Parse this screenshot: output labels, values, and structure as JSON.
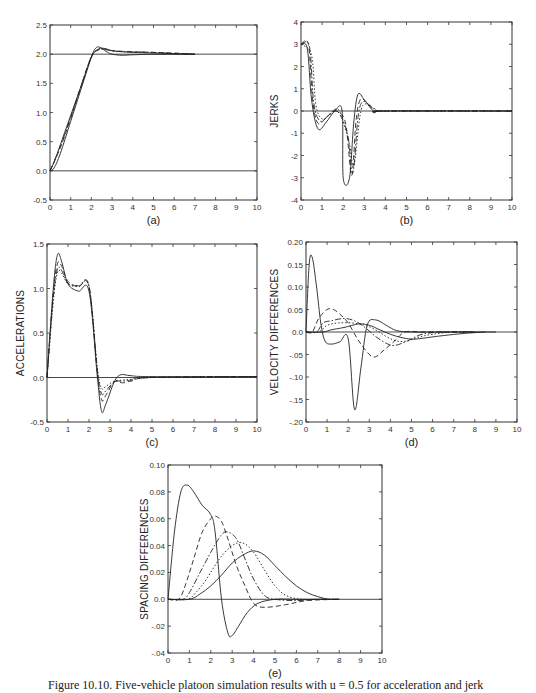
{
  "caption": "Figure 10.10. Five-vehicle platoon simulation results with u = 0.5 for acceleration and jerk",
  "chart_data": [
    {
      "panel": "(a)",
      "type": "line",
      "title": "",
      "xlabel": "",
      "ylabel": "",
      "xlim": [
        0,
        10
      ],
      "ylim": [
        -0.5,
        2.5
      ],
      "xticks": [
        "0",
        "1",
        "2",
        "3",
        "4",
        "5",
        "6",
        "7",
        "8",
        "9",
        "10"
      ],
      "yticks": [
        "-0.5",
        "0.0",
        "0.5",
        "1.0",
        "1.5",
        "2.0",
        "2.5"
      ],
      "reference_lines": [
        0.0,
        2.0
      ],
      "series": [
        {
          "name": "lead",
          "style": "solid",
          "x": [
            0,
            0.2,
            0.5,
            1,
            1.5,
            2,
            2.2,
            2.4,
            2.7,
            3,
            3.5,
            4,
            5,
            6,
            7
          ],
          "y": [
            0,
            0.05,
            0.3,
            0.85,
            1.4,
            1.95,
            2.1,
            2.12,
            2.05,
            2.0,
            1.98,
            1.99,
            2.0,
            2.0,
            2.0
          ]
        },
        {
          "name": "follower-1",
          "style": "solid",
          "x": [
            0,
            0.2,
            0.5,
            1,
            1.5,
            2,
            2.3,
            2.6,
            3,
            3.5,
            4,
            5,
            6,
            7
          ],
          "y": [
            0,
            0.15,
            0.45,
            0.95,
            1.45,
            1.95,
            2.08,
            2.1,
            2.06,
            2.04,
            2.03,
            2.02,
            2.01,
            2.0
          ]
        },
        {
          "name": "follower-2",
          "style": "dashed",
          "x": [
            0,
            0.5,
            1,
            1.5,
            2,
            2.3,
            2.6,
            3,
            3.5,
            4,
            5,
            6,
            7
          ],
          "y": [
            0,
            0.4,
            0.9,
            1.45,
            1.95,
            2.07,
            2.09,
            2.06,
            2.05,
            2.04,
            2.03,
            2.02,
            2.0
          ]
        },
        {
          "name": "follower-3",
          "style": "dashdot",
          "x": [
            0,
            0.5,
            1,
            1.5,
            2,
            2.4,
            2.8,
            3.2,
            4,
            5,
            6,
            7
          ],
          "y": [
            0,
            0.42,
            0.92,
            1.45,
            1.96,
            2.08,
            2.07,
            2.05,
            2.04,
            2.03,
            2.01,
            2.0
          ]
        }
      ]
    },
    {
      "panel": "(b)",
      "type": "line",
      "title": "",
      "xlabel": "",
      "ylabel": "JERKS",
      "xlim": [
        0,
        10
      ],
      "ylim": [
        -4,
        4
      ],
      "xticks": [
        "0",
        "1",
        "2",
        "3",
        "4",
        "5",
        "6",
        "7",
        "8",
        "9",
        "10"
      ],
      "yticks": [
        "-4",
        "-3",
        "-2",
        "-1",
        "0",
        "1",
        "2",
        "3",
        "4"
      ],
      "reference_lines": [
        0
      ],
      "series": [
        {
          "name": "lead",
          "style": "solid",
          "x": [
            0,
            0.3,
            0.5,
            0.8,
            1.2,
            1.6,
            1.95,
            2.0,
            2.3,
            2.5,
            2.7,
            3.0,
            3.5,
            4,
            10
          ],
          "y": [
            3,
            2.8,
            0.5,
            -0.8,
            -0.5,
            0,
            0,
            -3,
            -3,
            -0.5,
            0.75,
            0.5,
            -0.05,
            0,
            0
          ]
        },
        {
          "name": "follower-1",
          "style": "dashed",
          "x": [
            0,
            0.35,
            0.55,
            0.8,
            1.2,
            1.6,
            2.1,
            2.4,
            2.6,
            2.8,
            3.1,
            3.5,
            4,
            10
          ],
          "y": [
            3,
            3,
            0.5,
            -0.55,
            -0.3,
            0,
            -0.5,
            -2.9,
            -0.5,
            0.5,
            0.4,
            0,
            0,
            0
          ]
        },
        {
          "name": "follower-2",
          "style": "dashdot",
          "x": [
            0,
            0.4,
            0.6,
            0.9,
            1.3,
            1.7,
            2.2,
            2.45,
            2.7,
            2.9,
            3.2,
            3.6,
            4,
            10
          ],
          "y": [
            3,
            2.9,
            0.4,
            -0.45,
            -0.2,
            0.02,
            -1,
            -2.8,
            -0.3,
            0.4,
            0.3,
            0,
            0,
            0
          ]
        },
        {
          "name": "follower-3",
          "style": "dotted",
          "x": [
            0,
            0.5,
            0.7,
            1.0,
            1.4,
            1.8,
            2.3,
            2.5,
            2.8,
            3.0,
            3.3,
            3.7,
            4,
            10
          ],
          "y": [
            3,
            2.5,
            0.3,
            -0.35,
            -0.15,
            0.03,
            -1.5,
            -2.5,
            -0.2,
            0.3,
            0.2,
            0,
            0,
            0
          ]
        }
      ]
    },
    {
      "panel": "(c)",
      "type": "line",
      "title": "",
      "xlabel": "",
      "ylabel": "ACCELERATIONS",
      "xlim": [
        0,
        10
      ],
      "ylim": [
        -0.5,
        1.5
      ],
      "xticks": [
        "0",
        "1",
        "2",
        "3",
        "4",
        "5",
        "6",
        "7",
        "8",
        "9",
        "10"
      ],
      "yticks": [
        "-0.5",
        "0.0",
        "0.5",
        "1.0",
        "1.5"
      ],
      "reference_lines": [
        0.0
      ],
      "series": [
        {
          "name": "lead",
          "style": "solid",
          "x": [
            0,
            0.3,
            0.5,
            0.7,
            1.0,
            1.5,
            2.0,
            2.4,
            2.6,
            2.8,
            3.2,
            3.5,
            4,
            5,
            10
          ],
          "y": [
            0,
            1.0,
            1.38,
            1.3,
            1.05,
            0.97,
            0.97,
            0.0,
            -0.38,
            -0.3,
            -0.05,
            0.03,
            0.02,
            0.01,
            0.01
          ]
        },
        {
          "name": "follower-1",
          "style": "dashed",
          "x": [
            0,
            0.3,
            0.5,
            0.7,
            1.0,
            1.5,
            2.0,
            2.4,
            2.6,
            2.8,
            3.2,
            3.6,
            4,
            5,
            10
          ],
          "y": [
            0,
            0.95,
            1.28,
            1.25,
            1.08,
            1.02,
            1.02,
            0.05,
            -0.25,
            -0.2,
            -0.05,
            -0.06,
            -0.04,
            0.0,
            0.01
          ]
        },
        {
          "name": "follower-2",
          "style": "dashdot",
          "x": [
            0,
            0.3,
            0.5,
            0.7,
            1.0,
            1.5,
            2.0,
            2.4,
            2.6,
            2.8,
            3.2,
            3.6,
            4,
            5,
            10
          ],
          "y": [
            0,
            0.9,
            1.22,
            1.2,
            1.06,
            1.03,
            1.03,
            0.07,
            -0.18,
            -0.15,
            -0.05,
            -0.04,
            -0.03,
            0.0,
            0.01
          ]
        },
        {
          "name": "follower-3",
          "style": "dotted",
          "x": [
            0,
            0.3,
            0.5,
            0.7,
            1.0,
            1.5,
            2.0,
            2.4,
            2.6,
            2.8,
            3.2,
            3.6,
            4,
            5,
            10
          ],
          "y": [
            0,
            0.85,
            1.18,
            1.17,
            1.05,
            1.02,
            1.02,
            0.1,
            -0.12,
            -0.1,
            -0.04,
            -0.03,
            -0.02,
            0.0,
            0.01
          ]
        }
      ]
    },
    {
      "panel": "(d)",
      "type": "line",
      "title": "",
      "xlabel": "",
      "ylabel": "VELOCITY DIFFERENCES",
      "xlim": [
        0,
        10
      ],
      "ylim": [
        -0.2,
        0.2
      ],
      "xticks": [
        "0",
        "1",
        "2",
        "3",
        "4",
        "5",
        "6",
        "7",
        "8",
        "9",
        "10"
      ],
      "yticks": [
        "-.20",
        "-.15",
        "-.10",
        "-.05",
        "0.0",
        "0.05",
        "0.10",
        "0.15",
        "0.20"
      ],
      "reference_lines": [
        0.0
      ],
      "series": [
        {
          "name": "diff-1",
          "style": "solid",
          "x": [
            0,
            0.15,
            0.3,
            0.5,
            0.7,
            0.9,
            1.2,
            1.6,
            2.0,
            2.3,
            2.6,
            2.9,
            3.3,
            3.8,
            4.3,
            5,
            6,
            7,
            8,
            9
          ],
          "y": [
            0.0,
            0.15,
            0.165,
            0.1,
            0.02,
            -0.02,
            -0.027,
            -0.022,
            -0.015,
            -0.172,
            -0.08,
            0.015,
            0.027,
            0.015,
            0.003,
            0.0,
            0.0,
            0.0,
            0.0,
            0.0
          ]
        },
        {
          "name": "diff-2",
          "style": "dashed",
          "x": [
            0,
            0.3,
            0.6,
            1.0,
            1.3,
            1.6,
            2.0,
            2.5,
            3.0,
            3.3,
            3.7,
            4.2,
            4.7,
            5.5,
            6.5,
            8
          ],
          "y": [
            0,
            0.0,
            0.03,
            0.05,
            0.05,
            0.04,
            0.02,
            -0.02,
            -0.05,
            -0.055,
            -0.04,
            -0.02,
            0.0,
            0.0,
            0.0,
            0.0
          ]
        },
        {
          "name": "diff-3",
          "style": "dashdot",
          "x": [
            0,
            0.5,
            0.8,
            1.2,
            1.8,
            2.3,
            2.8,
            3.3,
            3.8,
            4.2,
            4.8,
            5.5,
            6.5,
            8
          ],
          "y": [
            0,
            0.0,
            0.02,
            0.025,
            0.03,
            0.025,
            0.01,
            -0.01,
            -0.025,
            -0.03,
            -0.02,
            -0.005,
            0.0,
            0.0
          ]
        },
        {
          "name": "diff-4",
          "style": "dotted",
          "x": [
            0,
            0.6,
            1.0,
            1.5,
            2.2,
            2.8,
            3.3,
            3.8,
            4.3,
            4.8,
            5.3,
            6,
            7,
            8
          ],
          "y": [
            0,
            0.0,
            0.015,
            0.02,
            0.02,
            0.015,
            0.005,
            -0.01,
            -0.02,
            -0.02,
            -0.012,
            -0.005,
            0.0,
            0.0
          ]
        },
        {
          "name": "diff-5",
          "style": "solid",
          "x": [
            0,
            0.8,
            1.2,
            1.8,
            2.5,
            3.0,
            3.5,
            4.0,
            4.5,
            5.0,
            5.5,
            6.5,
            7.5,
            8.5
          ],
          "y": [
            0,
            0.0,
            0.005,
            0.01,
            0.018,
            0.015,
            0.005,
            -0.005,
            -0.012,
            -0.016,
            -0.014,
            -0.008,
            -0.003,
            0.0
          ]
        }
      ]
    },
    {
      "panel": "(e)",
      "type": "line",
      "title": "",
      "xlabel": "",
      "ylabel": "SPACING DIFFERENCES",
      "xlim": [
        0,
        10
      ],
      "ylim": [
        -0.04,
        0.1
      ],
      "xticks": [
        "0",
        "1",
        "2",
        "3",
        "4",
        "5",
        "6",
        "7",
        "8",
        "9",
        "10"
      ],
      "yticks": [
        "-.04",
        "-.02",
        "0.0",
        "0.02",
        "0.04",
        "0.06",
        "0.08",
        "0.10"
      ],
      "reference_lines": [
        0.0
      ],
      "series": [
        {
          "name": "diff-1",
          "style": "solid",
          "x": [
            0,
            0.3,
            0.6,
            0.9,
            1.2,
            1.6,
            2.0,
            2.2,
            2.5,
            2.8,
            3.0,
            3.3,
            3.7,
            4.2,
            5,
            6,
            7,
            8
          ],
          "y": [
            0,
            0.05,
            0.08,
            0.085,
            0.08,
            0.07,
            0.063,
            0.05,
            0.0,
            -0.025,
            -0.027,
            -0.02,
            -0.01,
            -0.003,
            0.0,
            0.0,
            0.0,
            0.0
          ]
        },
        {
          "name": "diff-2",
          "style": "dashed",
          "x": [
            0,
            0.5,
            0.8,
            1.2,
            1.6,
            2.0,
            2.2,
            2.5,
            2.8,
            3.2,
            3.6,
            4.0,
            4.5,
            5.5,
            6.5,
            8
          ],
          "y": [
            0,
            0.0,
            0.01,
            0.03,
            0.05,
            0.06,
            0.062,
            0.058,
            0.045,
            0.025,
            0.01,
            -0.003,
            -0.006,
            -0.004,
            -0.001,
            0.0
          ]
        },
        {
          "name": "diff-3",
          "style": "dashdot",
          "x": [
            0,
            0.7,
            1.0,
            1.5,
            2.0,
            2.5,
            2.8,
            3.2,
            3.6,
            4.0,
            4.5,
            5.0,
            6.0,
            7.0,
            8
          ],
          "y": [
            0,
            0.0,
            0.005,
            0.02,
            0.035,
            0.048,
            0.05,
            0.045,
            0.03,
            0.015,
            0.003,
            0.0,
            -0.001,
            0.0,
            0.0
          ]
        },
        {
          "name": "diff-4",
          "style": "dotted",
          "x": [
            0,
            0.9,
            1.3,
            1.8,
            2.4,
            3.0,
            3.5,
            4.0,
            4.5,
            5.0,
            5.5,
            6.2,
            7.0,
            8
          ],
          "y": [
            0,
            0.0,
            0.005,
            0.015,
            0.03,
            0.04,
            0.042,
            0.035,
            0.022,
            0.01,
            0.003,
            0.0,
            0.0,
            0.0
          ]
        },
        {
          "name": "diff-5",
          "style": "solid",
          "x": [
            0,
            1.0,
            1.5,
            2.0,
            2.5,
            3.0,
            3.5,
            4.0,
            4.5,
            5.0,
            5.5,
            6.0,
            6.5,
            7.0,
            7.5,
            8
          ],
          "y": [
            0,
            0.0,
            0.004,
            0.01,
            0.018,
            0.027,
            0.033,
            0.036,
            0.033,
            0.025,
            0.017,
            0.01,
            0.005,
            0.002,
            0.0,
            0.0
          ]
        }
      ]
    }
  ]
}
